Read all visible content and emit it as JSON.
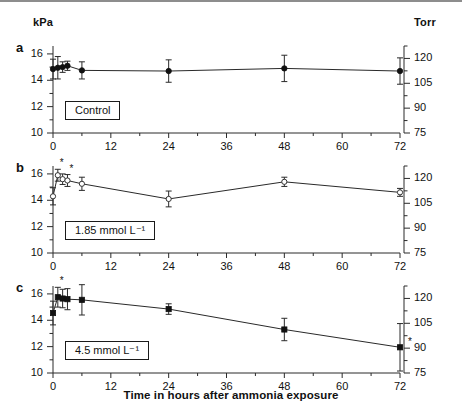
{
  "figure": {
    "left_unit": "kPa",
    "right_unit": "Torr",
    "xaxis_title": "Time in hours after ammonia exposure"
  },
  "chart_data": {
    "type": "line",
    "title": "Time in hours after ammonia exposure",
    "xlabel": "Time in hours after ammonia exposure",
    "ylabel": "kPa",
    "ylabel_right": "Torr",
    "xlim": [
      0,
      72
    ],
    "ylim": [
      10,
      17
    ],
    "ylim_right": [
      75,
      127.5
    ],
    "grid": false,
    "legend_position": "inset-box",
    "x_ticks": [
      0,
      12,
      24,
      36,
      48,
      60,
      72
    ],
    "x_minor_step": 6,
    "y_ticks_left": [
      10,
      12,
      14,
      16
    ],
    "y_minor_step_left": 1,
    "y_ticks_right": [
      75,
      90,
      105,
      120
    ],
    "y_minor_step_right": 7.5,
    "panels": [
      {
        "letter": "a",
        "legend": "Control",
        "marker": "filled-circle",
        "x": [
          0,
          1,
          2,
          3,
          6,
          24,
          48,
          72
        ],
        "values": [
          14.85,
          14.95,
          15.0,
          15.1,
          14.75,
          14.7,
          14.9,
          14.7
        ],
        "err": [
          0.75,
          0.85,
          0.4,
          0.35,
          0.65,
          0.85,
          1.0,
          1.0
        ],
        "significant": []
      },
      {
        "letter": "b",
        "legend": "1.85 mmol L⁻¹",
        "marker": "open-circle",
        "x": [
          0,
          1,
          2,
          3,
          6,
          24,
          48,
          72
        ],
        "values": [
          14.3,
          15.9,
          15.6,
          15.5,
          15.25,
          14.1,
          15.4,
          14.6
        ],
        "err": [
          0.65,
          0.45,
          0.4,
          0.45,
          0.5,
          0.6,
          0.35,
          0.3
        ],
        "significant": [
          1,
          3
        ]
      },
      {
        "letter": "c",
        "legend": "4.5 mmol L⁻¹",
        "marker": "filled-square",
        "x": [
          0,
          1,
          2,
          3,
          6,
          24,
          48,
          72
        ],
        "values": [
          14.55,
          15.75,
          15.65,
          15.6,
          15.55,
          14.85,
          13.3,
          11.95
        ],
        "err": [
          0.9,
          0.75,
          0.7,
          0.8,
          1.15,
          0.4,
          0.85,
          1.8
        ],
        "significant": [
          1,
          7
        ]
      }
    ]
  }
}
